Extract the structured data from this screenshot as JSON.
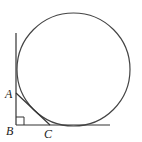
{
  "diagram": {
    "labels": {
      "A": "A",
      "B": "B",
      "C": "C"
    },
    "points": {
      "A": [
        16,
        93
      ],
      "B": [
        16,
        125
      ],
      "C": [
        50,
        125
      ]
    },
    "circle": {
      "cx": 73.5,
      "cy": 69.5,
      "r": 56.5
    },
    "stroke_color": "#333333"
  }
}
